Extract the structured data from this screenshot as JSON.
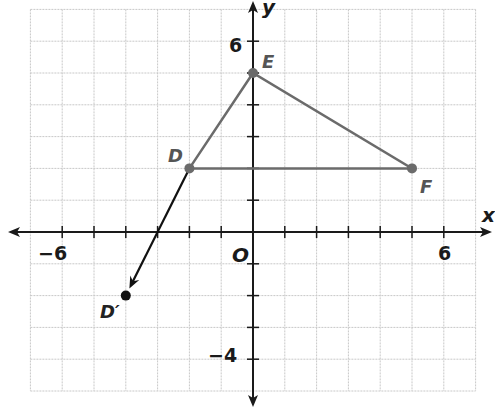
{
  "graph": {
    "origin_px": [
      253,
      232
    ],
    "unit_px": 31.8,
    "x_range": [
      -7,
      7
    ],
    "y_range": [
      -5,
      7
    ],
    "x_axis_label": "x",
    "y_axis_label": "y",
    "origin_label": "O",
    "tick_labels": {
      "x_neg": "−6",
      "x_pos": "6",
      "y_pos": "6",
      "y_neg": "−4"
    },
    "colors": {
      "grid": "#c8c8c8",
      "axis": "#1a1a1a",
      "triangle": "#6b6b6b",
      "vector": "#111111",
      "label": "#555555"
    }
  },
  "points": {
    "D": {
      "label": "D",
      "x": -2,
      "y": 2
    },
    "E": {
      "label": "E",
      "x": 0,
      "y": 5
    },
    "F": {
      "label": "F",
      "x": 5,
      "y": 2
    },
    "D_prime": {
      "label": "D′",
      "x": -4,
      "y": -2
    }
  },
  "chart_data": {
    "type": "scatter",
    "title": "",
    "xlabel": "x",
    "ylabel": "y",
    "xlim": [
      -7,
      7
    ],
    "ylim": [
      -5,
      7
    ],
    "grid": true,
    "series": [
      {
        "name": "Triangle DEF",
        "points": [
          {
            "label": "D",
            "x": -2,
            "y": 2
          },
          {
            "label": "E",
            "x": 0,
            "y": 5
          },
          {
            "label": "F",
            "x": 5,
            "y": 2
          }
        ],
        "closed": true
      },
      {
        "name": "Translation vector D to D'",
        "points": [
          {
            "label": "D",
            "x": -2,
            "y": 2
          },
          {
            "label": "D'",
            "x": -4,
            "y": -2
          }
        ],
        "arrow": true
      }
    ],
    "tick_labels": {
      "x": [
        "-6",
        "6"
      ],
      "y": [
        "-4",
        "6"
      ]
    },
    "annotations": [
      "O",
      "D",
      "E",
      "F",
      "D'"
    ]
  }
}
